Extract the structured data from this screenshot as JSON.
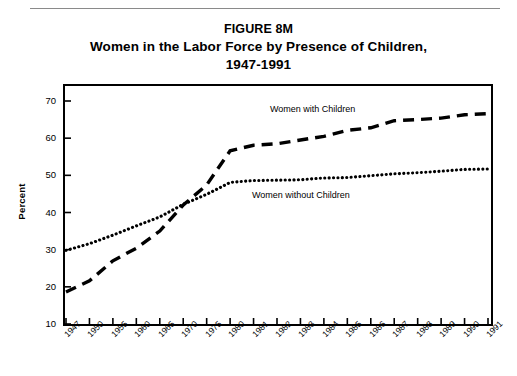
{
  "figure": {
    "rule_present": true,
    "title_lines": [
      "FIGURE 8M",
      "Women in the Labor Force by Presence of Children,",
      "1947-1991"
    ]
  },
  "chart_data": {
    "type": "line",
    "title": "Women in the Labor Force by Presence of Children, 1947-1991",
    "subtitle": "FIGURE 8M",
    "xlabel": "",
    "ylabel": "Percent",
    "ylim": [
      10,
      70
    ],
    "yticks": [
      10,
      20,
      30,
      40,
      50,
      60,
      70
    ],
    "grid": false,
    "legend_position": "inline-annotations",
    "categories": [
      "1947",
      "1950",
      "1955",
      "1960",
      "1965",
      "1970",
      "1975",
      "1980",
      "1981",
      "1982",
      "1983",
      "1984",
      "1985",
      "1986",
      "1987",
      "1988",
      "1989",
      "1990",
      "1991"
    ],
    "series": [
      {
        "name": "Women with Children",
        "style": "dashed",
        "color": "#000000",
        "values": [
          18.6,
          21.6,
          27.0,
          30.4,
          35.0,
          42.0,
          47.4,
          56.6,
          58.1,
          58.5,
          59.5,
          60.5,
          62.1,
          62.8,
          64.7,
          65.0,
          65.4,
          66.3,
          66.6
        ]
      },
      {
        "name": "Women without Children",
        "style": "dotted",
        "color": "#000000",
        "values": [
          29.8,
          31.6,
          33.9,
          36.4,
          38.8,
          42.2,
          44.9,
          48.1,
          48.6,
          48.7,
          48.8,
          49.3,
          49.4,
          49.9,
          50.4,
          50.7,
          51.1,
          51.6,
          51.7
        ]
      }
    ],
    "annotations": [
      {
        "text": "Women with Children",
        "x_value": "1978",
        "y_value": 64.5
      },
      {
        "text": "Women without Children",
        "x_value": "1981",
        "y_value": 43.5
      }
    ]
  }
}
